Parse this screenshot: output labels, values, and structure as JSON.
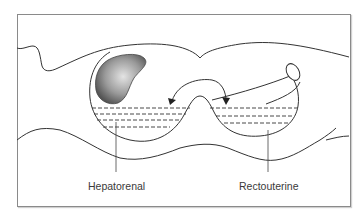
{
  "figure": {
    "type": "anatomical cross-section diagram",
    "labels": {
      "left_pouch": "Hepatorenal",
      "right_pouch": "Rectouterine"
    },
    "colors": {
      "line": "#333333",
      "frame": "#8a8a8a",
      "organ_fill_dark": "#6e6e6e",
      "organ_fill_light": "#d8d8d8",
      "background": "#ffffff"
    }
  }
}
